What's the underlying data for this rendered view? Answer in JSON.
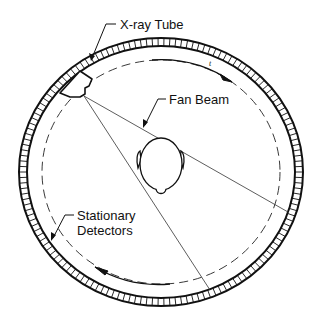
{
  "diagram": {
    "labels": {
      "xray_tube": "X-ray Tube",
      "fan_beam": "Fan Beam",
      "detectors_line1": "Stationary",
      "detectors_line2": "Detectors",
      "small_mark": "t"
    },
    "components": [
      "detector-ring",
      "source-path-circle",
      "x-ray-tube",
      "fan-beam",
      "patient-head",
      "rotation-arrows"
    ],
    "colors": {
      "line": "#111111",
      "background": "#ffffff"
    }
  }
}
